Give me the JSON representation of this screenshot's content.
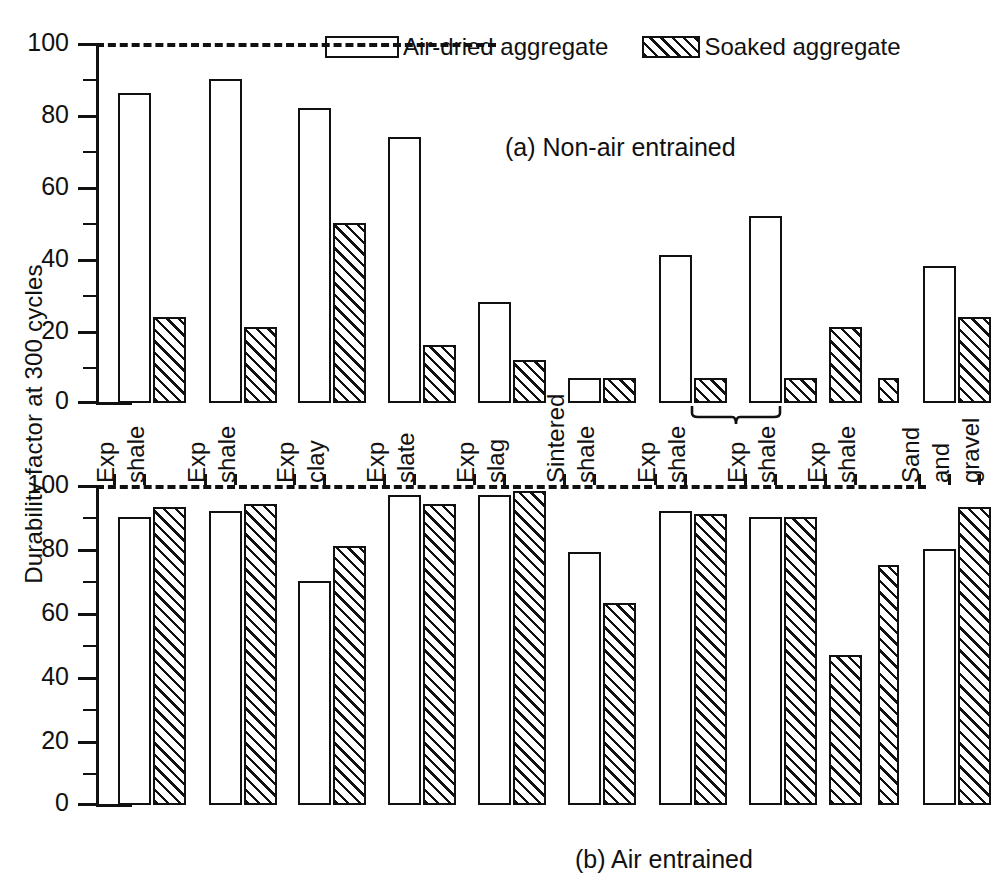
{
  "figure": {
    "ylabel": "Durability factor at 300 cycles",
    "legend": [
      {
        "key": "air-dried",
        "label": "Air-dried aggregate",
        "fill": "open"
      },
      {
        "key": "soaked",
        "label": "Soaked aggregate",
        "fill": "hatched"
      }
    ],
    "panel_a_caption": "(a) Non-air entrained",
    "panel_b_caption": "(b) Air entrained",
    "axis_color": "#111111"
  },
  "chart_data": [
    {
      "id": "panel-a",
      "type": "bar",
      "title": "(a) Non-air entrained",
      "xlabel": "",
      "ylabel": "Durability factor at 300 cycles",
      "ylim": [
        0,
        100
      ],
      "yticks": [
        0,
        20,
        40,
        60,
        80,
        100
      ],
      "yticks_minor": [
        10,
        30,
        50,
        70,
        90
      ],
      "grid": false,
      "legend_position": "top-right",
      "reference_line": {
        "value": 100,
        "style": "dashed"
      },
      "categories": [
        "Exp shale",
        "Exp shale",
        "Exp clay",
        "Exp slate",
        "Exp slag",
        "Sintered shale",
        "Exp shale",
        "Exp shale",
        "Exp shale",
        "Sand and gravel"
      ],
      "series": [
        {
          "name": "Air-dried aggregate",
          "fill": "open",
          "values": [
            86,
            90,
            82,
            74,
            28,
            7,
            41,
            52,
            21,
            38
          ]
        },
        {
          "name": "Soaked aggregate",
          "fill": "hatched",
          "values": [
            24,
            21,
            50,
            16,
            12,
            7,
            7,
            7,
            7,
            24
          ]
        }
      ],
      "annotations": [
        {
          "text": "brace",
          "group_index": 8,
          "note": "both bars hatched under brace"
        }
      ]
    },
    {
      "id": "panel-b",
      "type": "bar",
      "title": "(b) Air entrained",
      "xlabel": "",
      "ylabel": "Durability factor at 300 cycles",
      "ylim": [
        0,
        100
      ],
      "yticks": [
        0,
        20,
        40,
        60,
        80,
        100
      ],
      "yticks_minor": [
        10,
        30,
        50,
        70,
        90
      ],
      "grid": false,
      "reference_line": {
        "value": 100,
        "style": "dashed"
      },
      "categories": [
        "Exp shale",
        "Exp shale",
        "Exp clay",
        "Exp slate",
        "Exp slag",
        "Sintered shale",
        "Exp shale",
        "Exp shale",
        "Exp shale",
        "Sand and gravel"
      ],
      "series": [
        {
          "name": "Air-dried aggregate",
          "fill": "open",
          "values": [
            90,
            92,
            70,
            97,
            97,
            79,
            92,
            90,
            47,
            80
          ]
        },
        {
          "name": "Soaked aggregate",
          "fill": "hatched",
          "values": [
            93,
            94,
            81,
            94,
            98,
            63,
            91,
            90,
            75,
            93
          ]
        }
      ],
      "annotations": [
        {
          "text": "brace",
          "group_index": 8,
          "note": "both bars hatched in this group"
        }
      ]
    }
  ],
  "categories_labels": [
    {
      "line1": "Exp",
      "line2": "shale",
      "line3": ""
    },
    {
      "line1": "Exp",
      "line2": "shale",
      "line3": ""
    },
    {
      "line1": "Exp",
      "line2": "clay",
      "line3": ""
    },
    {
      "line1": "Exp",
      "line2": "slate",
      "line3": ""
    },
    {
      "line1": "Exp",
      "line2": "slag",
      "line3": ""
    },
    {
      "line1": "Sintered",
      "line2": "shale",
      "line3": ""
    },
    {
      "line1": "Exp",
      "line2": "shale",
      "line3": ""
    },
    {
      "line1": "Exp",
      "line2": "shale",
      "line3": ""
    },
    {
      "line1": "Exp",
      "line2": "shale",
      "line3": ""
    },
    {
      "line1": "Sand",
      "line2": "and",
      "line3": "gravel"
    }
  ],
  "ticks": {
    "t0": "0",
    "t20": "20",
    "t40": "40",
    "t60": "60",
    "t80": "80",
    "t100": "100"
  }
}
